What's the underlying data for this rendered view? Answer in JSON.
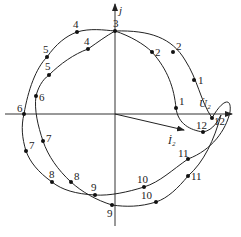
{
  "diagram": {
    "type": "phasor-locus",
    "axes": {
      "imaginary_label": "j",
      "origin": [
        115,
        114
      ]
    },
    "phasors": [
      {
        "name": "U2",
        "label": "U̇₂",
        "tip": [
          230,
          114
        ]
      },
      {
        "name": "I2",
        "label": "İ₂",
        "tip": [
          184,
          130
        ]
      }
    ],
    "curve_a": {
      "points": [
        {
          "n": "1",
          "x": 194,
          "y": 80
        },
        {
          "n": "2",
          "x": 173,
          "y": 52
        },
        {
          "n": "3",
          "x": 115,
          "y": 31
        },
        {
          "n": "4",
          "x": 77,
          "y": 32
        },
        {
          "n": "5",
          "x": 47,
          "y": 57
        },
        {
          "n": "6",
          "x": 24,
          "y": 114
        },
        {
          "n": "7",
          "x": 26,
          "y": 151
        },
        {
          "n": "8",
          "x": 52,
          "y": 182
        },
        {
          "n": "9",
          "x": 95,
          "y": 195
        },
        {
          "n": "10",
          "x": 144,
          "y": 187
        },
        {
          "n": "11",
          "x": 188,
          "y": 159
        },
        {
          "n": "12",
          "x": 212,
          "y": 118
        }
      ]
    },
    "curve_b": {
      "points": [
        {
          "n": "1",
          "x": 176,
          "y": 108
        },
        {
          "n": "2",
          "x": 152,
          "y": 52
        },
        {
          "n": "3",
          "x": 115,
          "y": 31
        },
        {
          "n": "4",
          "x": 88,
          "y": 49
        },
        {
          "n": "5",
          "x": 49,
          "y": 75
        },
        {
          "n": "6",
          "x": 36,
          "y": 96
        },
        {
          "n": "7",
          "x": 43,
          "y": 141
        },
        {
          "n": "8",
          "x": 71,
          "y": 182
        },
        {
          "n": "9",
          "x": 112,
          "y": 205
        },
        {
          "n": "10",
          "x": 156,
          "y": 202
        },
        {
          "n": "11",
          "x": 188,
          "y": 176
        },
        {
          "n": "12",
          "x": 203,
          "y": 132
        }
      ]
    }
  }
}
